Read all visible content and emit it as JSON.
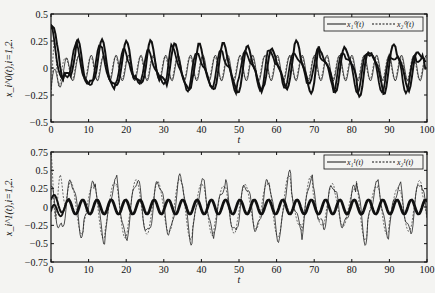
{
  "chart_data": [
    {
      "type": "line",
      "title": "",
      "xlabel": "t",
      "ylabel": "x_i^0(t),i=1,2.",
      "xlim": [
        0,
        100
      ],
      "ylim": [
        -0.5,
        0.5
      ],
      "xticks": [
        0,
        10,
        20,
        30,
        40,
        50,
        60,
        70,
        80,
        90,
        100
      ],
      "xtick_labels": [
        "0",
        "10",
        "20",
        "30",
        "40",
        "50",
        "60",
        "70",
        "80",
        "90",
        "100"
      ],
      "yticks": [
        0.5,
        0.25,
        0,
        -0.25,
        -0.5
      ],
      "ytick_labels": [
        "0.5",
        "0.25",
        "0",
        "−0.25",
        "−0.5"
      ],
      "legend": {
        "placement": "top-right",
        "entries": [
          {
            "label": "x₁⁰(t)",
            "style": "solid"
          },
          {
            "label": "x₂⁰(t)",
            "style": "dashed"
          }
        ]
      },
      "series_desc": "Multiple oscillating trajectories (thick and thin lines) around 0 with amplitude ~0.25, large transient near t=0–5",
      "series": [
        {
          "name": "thick",
          "amplitude": 0.22,
          "period": 6.5
        },
        {
          "name": "thin",
          "amplitude": 0.12,
          "period": 3.3
        }
      ]
    },
    {
      "type": "line",
      "title": "",
      "xlabel": "t",
      "ylabel": "x_i^1(t),i=1,2.",
      "xlim": [
        0,
        100
      ],
      "ylim": [
        -0.75,
        0.75
      ],
      "xticks": [
        0,
        10,
        20,
        30,
        40,
        50,
        60,
        70,
        80,
        90,
        100
      ],
      "xtick_labels": [
        "0",
        "10",
        "20",
        "30",
        "40",
        "50",
        "60",
        "70",
        "80",
        "90",
        "100"
      ],
      "yticks": [
        0.75,
        0.5,
        0.25,
        0,
        -0.25,
        -0.5,
        -0.75
      ],
      "ytick_labels": [
        "0.75",
        "0.5",
        "0.25",
        "0",
        "−0.25",
        "−0.5",
        "−0.75"
      ],
      "legend": {
        "placement": "top-right",
        "entries": [
          {
            "label": "x₁¹(t)",
            "style": "solid"
          },
          {
            "label": "x₂¹(t)",
            "style": "dashed"
          }
        ]
      },
      "series_desc": "Thick regular sinusoid amplitude ~0.1; thin irregular oscillation amplitude ~0.4; dashed transient up to 0.7 near t=0–4",
      "series": [
        {
          "name": "thick",
          "amplitude": 0.1,
          "period": 3.8
        },
        {
          "name": "thin",
          "amplitude": 0.38,
          "period": 5.8
        }
      ]
    }
  ]
}
